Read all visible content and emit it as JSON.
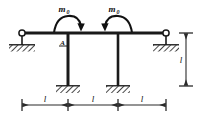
{
  "diagram": {
    "type": "engineering-free-body-diagram",
    "colors": {
      "line": "#1a1a1a",
      "beam": "#1a1a1a",
      "hatch": "#1a1a1a",
      "background": "#ffffff",
      "dimension": "#3a3a3a"
    },
    "labels": {
      "moment_left": "m",
      "moment_left_sub": "0",
      "moment_right": "m",
      "moment_right_sub": "0",
      "joint_a": "A",
      "span_left": "l",
      "span_middle": "l",
      "span_right": "l",
      "height": "l"
    },
    "members": {
      "beam": {
        "name": "horizontal-beam",
        "y": 33,
        "x_start": 22,
        "x_end": 166
      },
      "column_left": {
        "name": "left-column",
        "x": 68,
        "y_top": 33,
        "y_bottom": 86
      },
      "column_right": {
        "name": "right-column",
        "x": 118,
        "y_top": 33,
        "y_bottom": 86
      }
    },
    "supports": [
      {
        "name": "pin-support-left",
        "kind": "pin",
        "x": 22,
        "y": 33
      },
      {
        "name": "pin-support-right",
        "kind": "pin",
        "x": 166,
        "y": 33
      },
      {
        "name": "fixed-support-left-column",
        "kind": "fixed",
        "x": 68,
        "y": 86
      },
      {
        "name": "fixed-support-right-column",
        "kind": "fixed",
        "x": 118,
        "y": 86
      }
    ],
    "moments": [
      {
        "name": "moment-arrow-left",
        "at_x": 68,
        "direction": "clockwise"
      },
      {
        "name": "moment-arrow-right",
        "at_x": 118,
        "direction": "counterclockwise"
      }
    ],
    "dimensions": {
      "horizontal": {
        "y": 105,
        "stations": [
          22,
          68,
          118,
          166
        ]
      },
      "vertical": {
        "x": 186,
        "y_top": 33,
        "y_bottom": 86
      }
    }
  }
}
